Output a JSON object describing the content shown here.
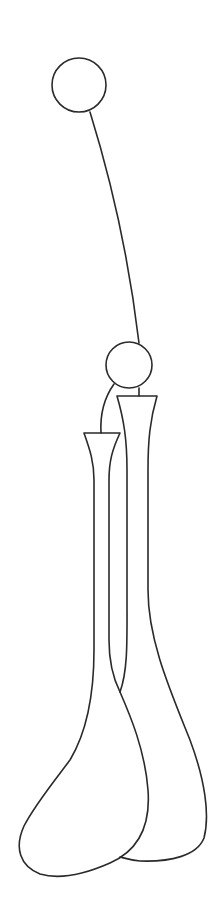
{
  "drawing": {
    "background": "#ffffff",
    "stroke_color": "#2a2a2a",
    "stroke_width": 1.6,
    "top_circle": {
      "cx": 79,
      "cy": 85,
      "r": 27
    },
    "mid_circle": {
      "cx": 129,
      "cy": 365,
      "r": 23
    },
    "string_top": "M90 112 C 108 170, 128 250, 139 343",
    "right_stem": "M139 388 L139 396",
    "left_tether": "M114 384 C 104 398, 100 415, 101 433",
    "right_vase": "M117 396 L157 396 C 150 420, 148 440, 148 470 L148 590 C 148 640, 170 690, 190 740 C 205 780, 210 815, 204 838 C 197 856, 170 862, 140 861 C 130 860, 124 858, 120 857 M117 396 C 124 420, 127 440, 127 470 L127 600 C 127 640, 128 670, 120 692",
    "left_vase": "M84 433 L120 433 C 112 450, 109 462, 109 480 L109 640 C 109 665, 114 680, 120 692 C 130 715, 145 750, 148 790 C 151 830, 135 852, 110 863 C 85 874, 60 880, 40 874 C 20 866, 14 848, 24 826 C 34 806, 55 780, 70 760 C 85 735, 94 700, 94 650 L94 480 C 94 462, 90 450, 84 433"
  }
}
